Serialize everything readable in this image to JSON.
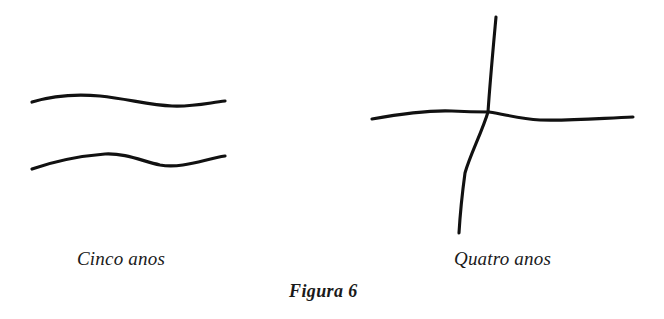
{
  "page": {
    "background_color": "#ffffff",
    "ink_color": "#111111",
    "width": 664,
    "height": 319,
    "kind": "scanned-book-figure"
  },
  "figure": {
    "caption": "Figura 6",
    "panels": [
      {
        "id": "cinco-anos",
        "label": "Cinco anos",
        "description": "two hand-drawn horizontal wavy lines, one above the other",
        "strokes": [
          {
            "name": "upper-wavy-line",
            "path": "M 32,102 C 55,95 78,94 100,96 C 128,99 150,105 172,106 C 192,107 208,103 225,101"
          },
          {
            "name": "lower-wavy-line",
            "path": "M 32,169 C 55,161 80,156 105,154 C 125,153 142,161 160,165 C 182,169 205,159 225,156"
          }
        ]
      },
      {
        "id": "quatro-anos",
        "label": "Quatro anos",
        "description": "hand-drawn cross: a long near-vertical stroke crossed by a long horizontal stroke",
        "strokes": [
          {
            "name": "vertical-stroke",
            "path": "M 496,17 C 493,50 490,82 488,112 C 482,132 470,155 465,173 C 462,195 460,216 459,233"
          },
          {
            "name": "horizontal-stroke",
            "path": "M 372,119 C 400,114 428,110 452,111 C 470,112 478,112 489,112 C 508,115 520,119 540,120 C 570,121 604,118 633,117"
          }
        ]
      }
    ]
  }
}
